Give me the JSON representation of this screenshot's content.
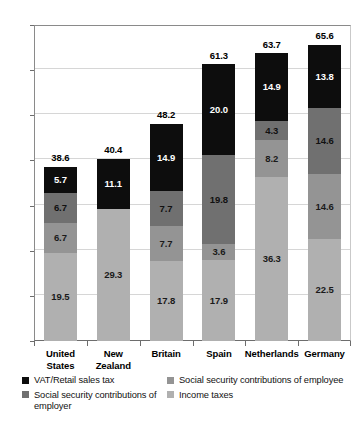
{
  "chart_data": {
    "type": "bar",
    "subtype": "stacked-vertical",
    "title": "",
    "xlabel": "",
    "ylabel": "",
    "ylim": [
      0,
      70
    ],
    "ytick_labels": [
      "0",
      "10",
      "20",
      "30",
      "40",
      "50",
      "60",
      "70"
    ],
    "ytick_values": [
      0,
      10,
      20,
      30,
      40,
      50,
      60,
      70
    ],
    "grid": true,
    "grid_axis": "y",
    "legend_position": "bottom",
    "categories": [
      "United States",
      "New Zealand",
      "Britain",
      "Spain",
      "Netherlands",
      "Germany"
    ],
    "category_labels": [
      [
        "United",
        "States"
      ],
      [
        "New",
        "Zealand"
      ],
      [
        "Britain"
      ],
      [
        "Spain"
      ],
      [
        "Netherlands"
      ],
      [
        "Germany"
      ]
    ],
    "series": [
      {
        "name": "Income taxes",
        "color": "#b0b0b0",
        "label_color": "#1a1a1a",
        "values": [
          19.5,
          29.3,
          17.8,
          17.9,
          36.3,
          22.5
        ],
        "value_labels": [
          "19.5",
          "29.3",
          "17.8",
          "17.9",
          "36.3",
          "22.5"
        ]
      },
      {
        "name": "Social security contributions of employee",
        "color": "#949494",
        "label_color": "#1a1a1a",
        "values": [
          6.7,
          0.0,
          7.7,
          3.6,
          8.2,
          14.6
        ],
        "value_labels": [
          "6.7",
          "",
          "7.7",
          "3.6",
          "8.2",
          "14.6"
        ]
      },
      {
        "name": "Social security contributions of employer",
        "color": "#707070",
        "label_color": "#111111",
        "values": [
          6.7,
          0.0,
          7.7,
          19.8,
          4.3,
          14.6
        ],
        "value_labels": [
          "6.7",
          "",
          "7.7",
          "19.8",
          "4.3",
          "14.6"
        ]
      },
      {
        "name": "VAT/Retail sales tax",
        "color": "#0d0d0d",
        "label_color": "#ffffff",
        "values": [
          5.7,
          11.1,
          14.9,
          20.0,
          14.9,
          13.8
        ],
        "value_labels": [
          "5.7",
          "11.1",
          "14.9",
          "20.0",
          "14.9",
          "13.8"
        ]
      }
    ],
    "totals": [
      38.6,
      40.4,
      48.2,
      61.3,
      63.7,
      65.6
    ],
    "total_labels": [
      "38.6",
      "40.4",
      "48.2",
      "61.3",
      "63.7",
      "65.6"
    ],
    "annotations": []
  },
  "legend": {
    "left_column": [
      {
        "label": "VAT/Retail sales tax",
        "swatch": "#0d0d0d",
        "icon": "legend-swatch-icon"
      },
      {
        "label": "Social security contributions of employer",
        "swatch": "#707070",
        "icon": "legend-swatch-icon"
      }
    ],
    "right_column": [
      {
        "label": "Social security contributions of employee",
        "swatch": "#949494",
        "icon": "legend-swatch-icon"
      },
      {
        "label": "Income taxes",
        "swatch": "#b0b0b0",
        "icon": "legend-swatch-icon"
      }
    ]
  },
  "colors": {
    "vat": "#0d0d0d",
    "ssc_employer": "#707070",
    "ssc_employee": "#949494",
    "income_tax": "#b0b0b0",
    "grid": "#d6d6d6",
    "axis": "#6d6d6d",
    "background": "#ffffff"
  }
}
